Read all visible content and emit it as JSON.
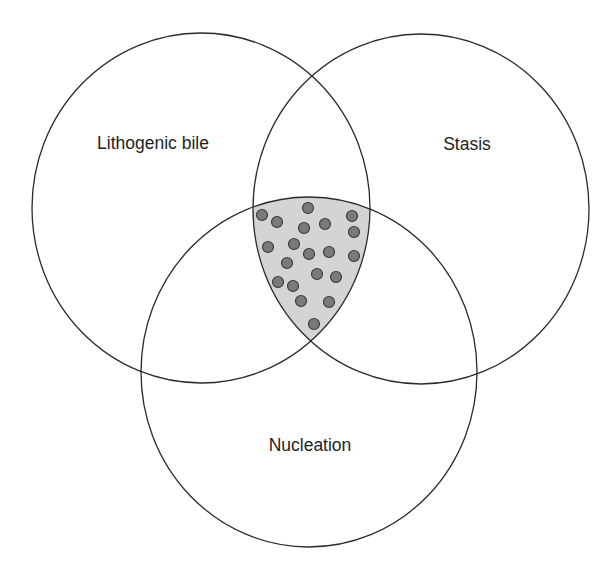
{
  "diagram": {
    "type": "venn",
    "sets": [
      {
        "id": "lithogenic",
        "label": "Lithogenic bile",
        "cx": 201,
        "cy": 208,
        "rx": 169,
        "ry": 175,
        "label_x": 153,
        "label_y": 149
      },
      {
        "id": "stasis",
        "label": "Stasis",
        "cx": 421,
        "cy": 209,
        "rx": 168,
        "ry": 175,
        "label_x": 467,
        "label_y": 150
      },
      {
        "id": "nucleation",
        "label": "Nucleation",
        "cx": 309,
        "cy": 372,
        "rx": 168,
        "ry": 175,
        "label_x": 310,
        "label_y": 451
      }
    ],
    "intersection": {
      "description": "Triple intersection (all three sets) shaded with dots",
      "fill": "#d4d4d4",
      "dot_color": "#7a7a7a",
      "dot_radius": 5.5,
      "dots": [
        [
          262,
          215
        ],
        [
          308,
          208
        ],
        [
          277,
          222
        ],
        [
          352,
          216
        ],
        [
          304,
          228
        ],
        [
          325,
          224
        ],
        [
          354,
          232
        ],
        [
          268,
          247
        ],
        [
          294,
          244
        ],
        [
          309,
          254
        ],
        [
          329,
          252
        ],
        [
          354,
          256
        ],
        [
          287,
          263
        ],
        [
          317,
          274
        ],
        [
          336,
          277
        ],
        [
          278,
          282
        ],
        [
          293,
          286
        ],
        [
          301,
          301
        ],
        [
          329,
          302
        ],
        [
          314,
          324
        ]
      ]
    },
    "colors": {
      "outline": "#2b2b2b",
      "background": "#ffffff"
    }
  }
}
